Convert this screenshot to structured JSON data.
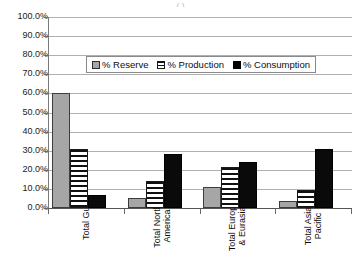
{
  "title_cropped": "(            )",
  "chart_data": {
    "type": "bar",
    "title": "",
    "xlabel": "",
    "ylabel": "",
    "ylim": [
      0,
      100
    ],
    "ytick_labels": [
      "100.0%",
      "90.0%",
      "80.0%",
      "70.0%",
      "60.0%",
      "50.0%",
      "40.0%",
      "30.0%",
      "20.0%",
      "10.0%",
      "0.0%"
    ],
    "ytick_values": [
      100,
      90,
      80,
      70,
      60,
      50,
      40,
      30,
      20,
      10,
      0
    ],
    "grid": true,
    "legend_position": "inside-upper-center",
    "categories": [
      "Total Gulf",
      "Total North\nAmerica",
      "Total Europe\n& Eurasia",
      "Total Asia\nPacific"
    ],
    "series": [
      {
        "name": "% Reserve",
        "values": [
          60.0,
          5.0,
          11.0,
          3.5
        ],
        "color": "#a6a6a6",
        "pattern": "solid-gray"
      },
      {
        "name": "% Production",
        "values": [
          31.0,
          14.0,
          21.5,
          9.5
        ],
        "color": "#ffffff",
        "pattern": "horizontal-stripes"
      },
      {
        "name": "% Consumption",
        "values": [
          7.0,
          28.5,
          24.0,
          31.0
        ],
        "color": "#000000",
        "pattern": "solid-black"
      }
    ]
  },
  "legend": {
    "items": [
      {
        "label": "% Reserve"
      },
      {
        "label": "% Production"
      },
      {
        "label": "% Consumption"
      }
    ]
  }
}
